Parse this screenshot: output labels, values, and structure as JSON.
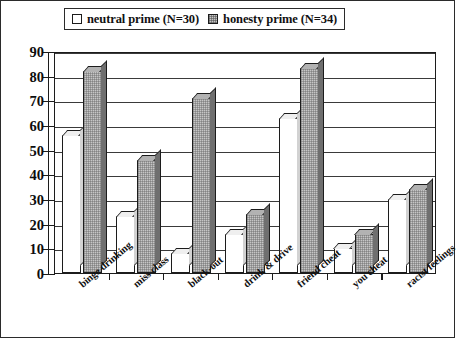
{
  "chart_data": {
    "type": "bar",
    "title": "",
    "subtitle": "",
    "xlabel": "",
    "ylabel": "",
    "ylim": [
      0,
      90
    ],
    "ytick_labels": [
      "0",
      "10",
      "20",
      "30",
      "40",
      "50",
      "60",
      "70",
      "80",
      "90"
    ],
    "ytick_values": [
      0,
      10,
      20,
      30,
      40,
      50,
      60,
      70,
      80,
      90
    ],
    "grid": true,
    "grid_axis": "y",
    "legend_position": "top",
    "orientation": "vertical",
    "style_3d": true,
    "categories": [
      "binge drinking",
      "miss class",
      "black-out",
      "drink & drive",
      "friend cheat",
      "you cheat",
      "racist feelings"
    ],
    "series": [
      {
        "name": "neutral prime (N=30)",
        "color": "#ffffff",
        "values": [
          56,
          23,
          8,
          16,
          63,
          10,
          30
        ]
      },
      {
        "name": "honesty prime (N=34)",
        "color": "#c6c6c6",
        "values": [
          82,
          46,
          71,
          24,
          83,
          16,
          34
        ]
      }
    ]
  },
  "legend": {
    "entries": [
      {
        "label": "neutral prime (N=30)",
        "swatch": "white-square-icon"
      },
      {
        "label": "honesty prime (N=34)",
        "swatch": "gray-hatched-square-icon"
      }
    ]
  }
}
